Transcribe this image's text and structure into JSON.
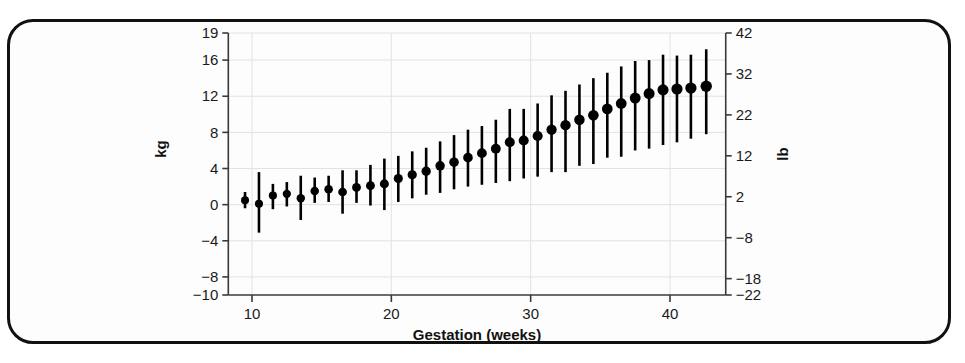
{
  "figure": {
    "frame_color": "#111111",
    "background": "#ffffff"
  },
  "chart_data": {
    "type": "scatter",
    "title": "",
    "xlabel": "Gestation (weeks)",
    "ylabel": "kg",
    "y2label": "lb",
    "grid": true,
    "legend": "none",
    "xlim": [
      8.3,
      44.0
    ],
    "ylim": [
      -10,
      19
    ],
    "y2lim": [
      -22,
      42
    ],
    "xticks": [
      10,
      20,
      30,
      40
    ],
    "xtick_labels": [
      "10",
      "20",
      "30",
      "40"
    ],
    "yticks": [
      -10,
      -8,
      -4,
      0,
      4,
      8,
      12,
      16,
      19
    ],
    "ytick_labels": [
      "-10",
      "-8",
      "-4",
      "0",
      "4",
      "8",
      "12",
      "16",
      "19"
    ],
    "y2ticks": [
      -22,
      -18,
      -8,
      2,
      12,
      22,
      32,
      42
    ],
    "y2tick_labels": [
      "-22",
      "-18",
      "-8",
      "2",
      "12",
      "22",
      "32",
      "42"
    ],
    "marker": "filled-circle",
    "error_bars": "vertical",
    "x": [
      9.5,
      10.5,
      11.5,
      12.5,
      13.5,
      14.5,
      15.5,
      16.5,
      17.5,
      18.5,
      19.5,
      20.5,
      21.5,
      22.5,
      23.5,
      24.5,
      25.5,
      26.5,
      27.5,
      28.5,
      29.5,
      30.5,
      31.5,
      32.5,
      33.5,
      34.5,
      35.5,
      36.5,
      37.5,
      38.5,
      39.5,
      40.5,
      41.5,
      42.6
    ],
    "y": [
      0.5,
      0.1,
      1.0,
      1.2,
      0.7,
      1.5,
      1.7,
      1.4,
      1.9,
      2.1,
      2.3,
      2.9,
      3.3,
      3.7,
      4.3,
      4.7,
      5.2,
      5.7,
      6.2,
      6.9,
      7.1,
      7.6,
      8.3,
      8.8,
      9.4,
      9.9,
      10.6,
      11.2,
      11.8,
      12.3,
      12.7,
      12.8,
      12.9,
      13.1
    ],
    "y_lower": [
      -0.4,
      -3.1,
      -0.5,
      -0.2,
      -1.7,
      0.2,
      0.3,
      -1.0,
      0.2,
      -0.1,
      -0.6,
      0.3,
      0.7,
      1.1,
      1.3,
      1.7,
      2.0,
      2.2,
      2.4,
      2.6,
      2.9,
      3.1,
      3.6,
      3.6,
      4.3,
      4.5,
      5.2,
      5.3,
      6.0,
      6.2,
      6.6,
      6.9,
      7.3,
      7.8
    ],
    "y_upper": [
      1.4,
      3.6,
      2.3,
      2.5,
      3.2,
      3.0,
      3.2,
      3.8,
      3.8,
      4.4,
      5.1,
      5.4,
      5.9,
      6.3,
      7.0,
      7.7,
      8.3,
      8.7,
      9.4,
      10.6,
      10.6,
      11.2,
      12.1,
      12.6,
      13.3,
      14.0,
      14.6,
      15.3,
      15.9,
      16.0,
      16.6,
      16.5,
      16.6,
      17.2
    ],
    "series_description": "Mean maternal weight gain by gestational age with vertical error bars"
  }
}
